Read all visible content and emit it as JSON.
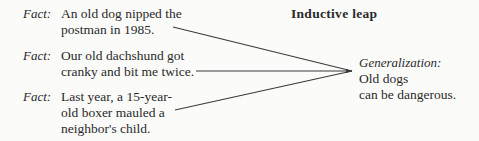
{
  "title": "Inductive leap",
  "facts": [
    {
      "label": "Fact:",
      "lines": [
        "An old dog nipped the",
        "postman in 1985."
      ]
    },
    {
      "label": "Fact:",
      "lines": [
        "Our old dachshund got",
        "cranky and bit me twice."
      ]
    },
    {
      "label": "Fact:",
      "lines": [
        "Last year, a 15-year-",
        "old boxer mauled a",
        "neighbor's child."
      ]
    }
  ],
  "generalization": {
    "label": "Generalization:",
    "lines": [
      "Old dogs",
      "can be dangerous."
    ]
  },
  "colors": {
    "line": "#3a3a3a",
    "text": "#2a2a2a",
    "background": "#fbfbfa"
  }
}
